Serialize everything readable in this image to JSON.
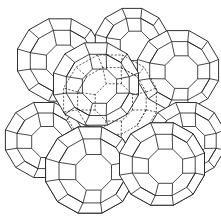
{
  "figure": {
    "description": "Zeolite framework line drawing: sodalite cages (truncated octahedra) linked by double four-rings, with a central supercage shown in dashed lines",
    "stroke_color": "#1a1a1a",
    "background_color": "#ffffff",
    "cages": [
      {
        "id": "cage-back-top-left",
        "cx": 60,
        "cy": 60,
        "r": 44
      },
      {
        "id": "cage-back-top-right",
        "cx": 132,
        "cy": 44,
        "r": 38
      },
      {
        "id": "cage-back-bottom-left",
        "cx": 44,
        "cy": 140,
        "r": 40
      },
      {
        "id": "cage-front-top-right",
        "cx": 178,
        "cy": 70,
        "r": 42
      },
      {
        "id": "cage-front-top-center",
        "cx": 96,
        "cy": 84,
        "r": 44
      },
      {
        "id": "cage-front-bottom-right",
        "cx": 186,
        "cy": 140,
        "r": 40
      },
      {
        "id": "cage-front-bottom-center-right",
        "cx": 162,
        "cy": 164,
        "r": 44
      },
      {
        "id": "cage-front-bottom-left",
        "cx": 90,
        "cy": 170,
        "r": 46
      }
    ],
    "central_cage": {
      "style": "dashed",
      "cx": 110,
      "cy": 100,
      "r": 48
    }
  }
}
